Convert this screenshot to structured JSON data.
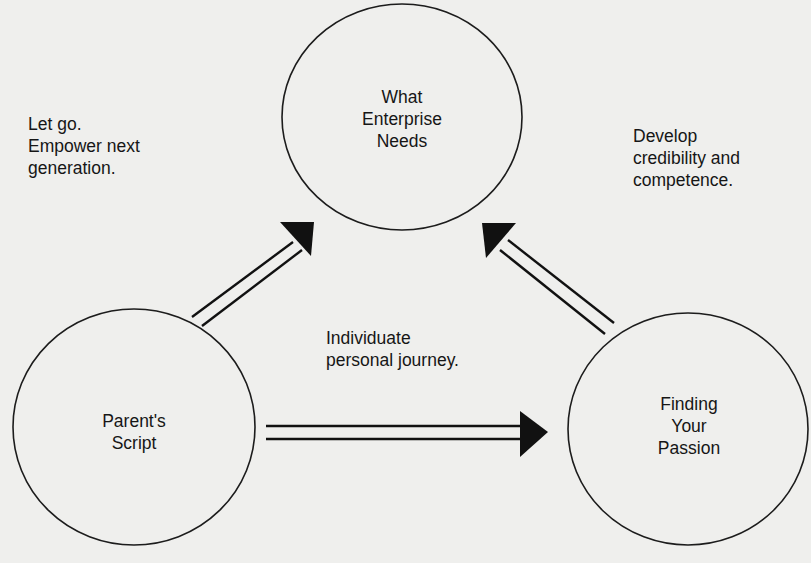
{
  "diagram": {
    "type": "cycle",
    "nodes": [
      {
        "id": "enterprise",
        "label_lines": [
          "What",
          "Enterprise",
          "Needs"
        ]
      },
      {
        "id": "parents",
        "label_lines": [
          "Parent's",
          "Script"
        ]
      },
      {
        "id": "passion",
        "label_lines": [
          "Finding",
          "Your",
          "Passion"
        ]
      }
    ],
    "edges": [
      {
        "from": "parents",
        "to": "enterprise",
        "style": "double-line-arrow"
      },
      {
        "from": "passion",
        "to": "enterprise",
        "style": "double-line-arrow"
      },
      {
        "from": "parents",
        "to": "passion",
        "style": "double-line-arrow"
      }
    ],
    "annotations": [
      {
        "id": "let-go",
        "lines": [
          "Let go.",
          "Empower next",
          "generation."
        ]
      },
      {
        "id": "develop",
        "lines": [
          "Develop",
          "credibility and",
          "competence."
        ]
      },
      {
        "id": "individuate",
        "lines": [
          "Individuate",
          "personal journey."
        ]
      }
    ]
  },
  "colors": {
    "paper": "#efefed",
    "ink": "#161616",
    "bleed_through": "#d9d9d6"
  }
}
